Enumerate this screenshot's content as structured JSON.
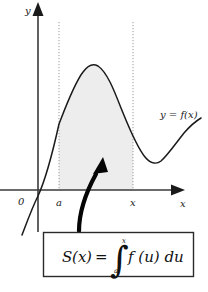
{
  "figure": {
    "background_color": "#ffffff",
    "ink_color": "#1a1a1a",
    "shade_color": "#ededed",
    "dotted_color": "#9a9a9a"
  },
  "axes": {
    "y_axis_label": "y",
    "x_axis_label": "x",
    "origin_label": "0"
  },
  "ticks": {
    "lower_limit_label": "a",
    "upper_limit_label": "x"
  },
  "curve": {
    "label": "y = f(x)",
    "label_parts": {
      "y": "y",
      "equals": "=",
      "f": "f",
      "open_paren": "(",
      "argument": "x",
      "close_paren": ")"
    }
  },
  "shaded_region": {
    "description": "area under curve between a and x"
  },
  "callout_arrow": {
    "description": "curved arrow from formula box to shaded region"
  },
  "formula_box": {
    "function_name": "S",
    "function_open": "(",
    "function_arg": "x",
    "function_close": ")",
    "equals": "=",
    "integral_sign": "∫",
    "upper_limit": "x",
    "lower_limit": "a",
    "integrand": "f (u) du",
    "full_text": "S(x) = ∫ₐˣ f(u) du"
  }
}
